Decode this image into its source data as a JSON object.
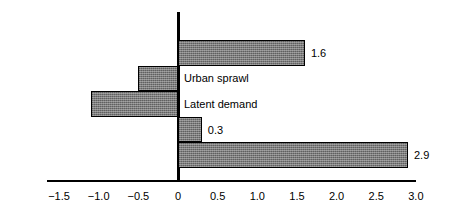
{
  "chart_data": {
    "type": "bar",
    "orientation": "horizontal",
    "title": "",
    "subtitle": "",
    "xlabel": "",
    "ylabel": "",
    "xlim": [
      -1.75,
      3.15
    ],
    "grid": false,
    "legend": null,
    "axis_baseline": 0,
    "tick_labels": [
      "−1.5",
      "−1.0",
      "−0.5",
      "0",
      "0.5",
      "1.0",
      "1.5",
      "2.0",
      "2.5",
      "3.0"
    ],
    "tick_values": [
      -1.5,
      -1.0,
      -0.5,
      0,
      0.5,
      1.0,
      1.5,
      2.0,
      2.5,
      3.0
    ],
    "categories": [
      "Net benefit",
      "Urban sprawl",
      "Latent demand",
      "Improved traffic flow",
      "Direct benefit"
    ],
    "values": [
      1.6,
      -0.5,
      -1.1,
      0.3,
      2.9
    ],
    "value_labels": [
      "1.6",
      "−0.5",
      "−1.1",
      "0.3",
      "2.9"
    ],
    "bars": [
      {
        "category": "Net benefit",
        "value": 1.6,
        "value_label": "1.6",
        "label_side": "left",
        "value_side": "right"
      },
      {
        "category": "Urban sprawl",
        "value": -0.5,
        "value_label": "−0.5",
        "label_side": "right",
        "value_side": "left"
      },
      {
        "category": "Latent demand",
        "value": -1.1,
        "value_label": "−1.1",
        "label_side": "right",
        "value_side": "left"
      },
      {
        "category": "Improved traffic flow",
        "value": 0.3,
        "value_label": "0.3",
        "label_side": "left",
        "value_side": "right"
      },
      {
        "category": "Direct benefit",
        "value": 2.9,
        "value_label": "2.9",
        "label_side": "left",
        "value_side": "right"
      }
    ],
    "colors": {
      "bar_fill": "#7b7b7b",
      "bar_border": "#000000",
      "axis": "#000000",
      "background": "#ffffff",
      "text": "#000000"
    }
  }
}
